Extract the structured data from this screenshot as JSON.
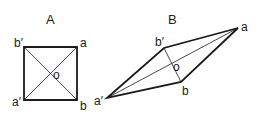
{
  "figures": [
    {
      "title": "A",
      "shape": "square",
      "vertices": {
        "b_prime": {
          "label": "b′",
          "x": 24,
          "y": 47
        },
        "a": {
          "label": "a",
          "x": 77,
          "y": 47
        },
        "b": {
          "label": "b",
          "x": 77,
          "y": 100
        },
        "a_prime": {
          "label": "a′",
          "x": 24,
          "y": 100
        }
      },
      "center": {
        "label": "o",
        "x": 51,
        "y": 73
      }
    },
    {
      "title": "B",
      "shape": "rhombus",
      "vertices": {
        "b_prime": {
          "label": "b′",
          "x": 164,
          "y": 48
        },
        "a": {
          "label": "a",
          "x": 238,
          "y": 28
        },
        "b": {
          "label": "b",
          "x": 181,
          "y": 82
        },
        "a_prime": {
          "label": "a′",
          "x": 107,
          "y": 98
        }
      },
      "center": {
        "label": "o",
        "x": 172,
        "y": 65
      }
    }
  ],
  "colors": {
    "stroke": "#1a1a1a",
    "background": "#ffffff"
  }
}
